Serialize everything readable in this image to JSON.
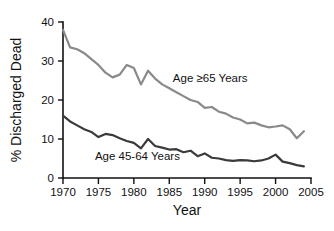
{
  "chart_data": {
    "type": "line",
    "title": "",
    "xlabel": "Year",
    "ylabel": "% Discharged Dead",
    "xlim": [
      1970,
      2005
    ],
    "ylim": [
      0,
      40
    ],
    "xticks": [
      1970,
      1975,
      1980,
      1985,
      1990,
      1995,
      2000,
      2005
    ],
    "yticks": [
      0,
      10,
      20,
      30,
      40
    ],
    "grid": false,
    "legend_position": "inline-annotation",
    "x": [
      1970,
      1971,
      1972,
      1973,
      1974,
      1975,
      1976,
      1977,
      1978,
      1979,
      1980,
      1981,
      1982,
      1983,
      1984,
      1985,
      1986,
      1987,
      1988,
      1989,
      1990,
      1991,
      1992,
      1993,
      1994,
      1995,
      1996,
      1997,
      1998,
      1999,
      2000,
      2001,
      2002,
      2003,
      2004
    ],
    "series": [
      {
        "name": "Age ≥65 Years",
        "color": "#8a8a8a",
        "label_x": 1985.5,
        "label_y": 24.5,
        "values": [
          38.0,
          33.5,
          33.0,
          32.0,
          30.5,
          29.0,
          27.0,
          25.8,
          26.5,
          29.0,
          28.2,
          24.0,
          27.5,
          25.5,
          24.0,
          23.0,
          22.0,
          21.0,
          20.0,
          19.5,
          18.0,
          18.2,
          17.0,
          16.5,
          15.5,
          15.0,
          14.0,
          14.2,
          13.5,
          13.0,
          13.2,
          13.5,
          12.5,
          10.2,
          12.0
        ]
      },
      {
        "name": "Age 45-64 Years",
        "color": "#3a3a3a",
        "label_x": 1974.5,
        "label_y": 4.6,
        "values": [
          16.0,
          14.5,
          13.5,
          12.5,
          11.8,
          10.5,
          11.3,
          11.0,
          10.2,
          9.5,
          9.0,
          7.6,
          10.0,
          8.2,
          7.8,
          7.3,
          7.4,
          6.6,
          7.0,
          5.6,
          6.3,
          5.2,
          5.0,
          4.6,
          4.4,
          4.6,
          4.5,
          4.3,
          4.5,
          5.0,
          6.0,
          4.2,
          3.8,
          3.3,
          3.0
        ]
      }
    ]
  }
}
